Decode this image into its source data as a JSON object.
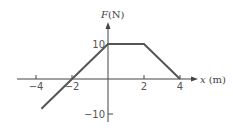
{
  "chart_data": {
    "type": "line",
    "title": "",
    "xlabel": "x (m)",
    "ylabel": "F(N)",
    "xlabel_var": "x",
    "xlabel_unit": "(m)",
    "ylabel_var": "F",
    "ylabel_unit": "(N)",
    "x_ticks": [
      -4,
      -2,
      2,
      4
    ],
    "x_tick_labels": [
      "−4",
      "−2",
      "2",
      "4"
    ],
    "y_ticks": [
      10,
      -10
    ],
    "y_tick_labels": [
      "10",
      "−10"
    ],
    "xlim": [
      -5.9,
      6.5
    ],
    "ylim": [
      -13,
      15
    ],
    "grid": false,
    "legend": null,
    "series": [
      {
        "name": "F(x)",
        "x": [
          -3.7,
          -2,
          0,
          2,
          4
        ],
        "y": [
          -8.5,
          0,
          10,
          10,
          0
        ],
        "color": "#555555"
      }
    ]
  },
  "colors": {
    "axis": "#444444",
    "series": "#555555",
    "background": "#ffffff"
  }
}
